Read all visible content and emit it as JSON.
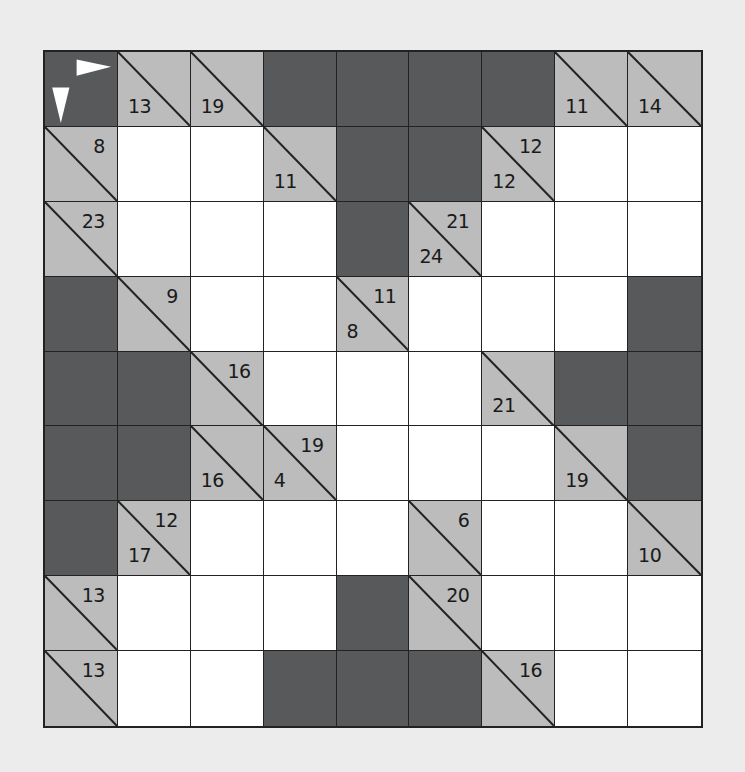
{
  "puzzle": {
    "type": "kakuro",
    "rows": 9,
    "cols": 9,
    "colors": {
      "background": "#ececec",
      "block": "#58595b",
      "clue": "#bcbcbc",
      "entry": "#ffffff",
      "line": "#222222"
    },
    "legend": {
      "corner_icon": "across-and-down-arrows-icon"
    },
    "grid": [
      [
        {
          "t": "corner"
        },
        {
          "t": "clue",
          "down": "13"
        },
        {
          "t": "clue",
          "down": "19"
        },
        {
          "t": "block"
        },
        {
          "t": "block"
        },
        {
          "t": "block"
        },
        {
          "t": "block"
        },
        {
          "t": "clue",
          "down": "11"
        },
        {
          "t": "clue",
          "down": "14"
        }
      ],
      [
        {
          "t": "clue",
          "across": "8"
        },
        {
          "t": "entry",
          "value": ""
        },
        {
          "t": "entry",
          "value": ""
        },
        {
          "t": "clue",
          "down": "11"
        },
        {
          "t": "block"
        },
        {
          "t": "block"
        },
        {
          "t": "clue",
          "across": "12",
          "down": "12"
        },
        {
          "t": "entry",
          "value": ""
        },
        {
          "t": "entry",
          "value": ""
        }
      ],
      [
        {
          "t": "clue",
          "across": "23"
        },
        {
          "t": "entry",
          "value": ""
        },
        {
          "t": "entry",
          "value": ""
        },
        {
          "t": "entry",
          "value": ""
        },
        {
          "t": "block"
        },
        {
          "t": "clue",
          "across": "21",
          "down": "24"
        },
        {
          "t": "entry",
          "value": ""
        },
        {
          "t": "entry",
          "value": ""
        },
        {
          "t": "entry",
          "value": ""
        }
      ],
      [
        {
          "t": "block"
        },
        {
          "t": "clue",
          "across": "9"
        },
        {
          "t": "entry",
          "value": ""
        },
        {
          "t": "entry",
          "value": ""
        },
        {
          "t": "clue",
          "across": "11",
          "down": "8"
        },
        {
          "t": "entry",
          "value": ""
        },
        {
          "t": "entry",
          "value": ""
        },
        {
          "t": "entry",
          "value": ""
        },
        {
          "t": "block"
        }
      ],
      [
        {
          "t": "block"
        },
        {
          "t": "block"
        },
        {
          "t": "clue",
          "across": "16"
        },
        {
          "t": "entry",
          "value": ""
        },
        {
          "t": "entry",
          "value": ""
        },
        {
          "t": "entry",
          "value": ""
        },
        {
          "t": "clue",
          "down": "21"
        },
        {
          "t": "block"
        },
        {
          "t": "block"
        }
      ],
      [
        {
          "t": "block"
        },
        {
          "t": "block"
        },
        {
          "t": "clue",
          "down": "16"
        },
        {
          "t": "clue",
          "across": "19",
          "down": "4"
        },
        {
          "t": "entry",
          "value": ""
        },
        {
          "t": "entry",
          "value": ""
        },
        {
          "t": "entry",
          "value": ""
        },
        {
          "t": "clue",
          "down": "19"
        },
        {
          "t": "block"
        }
      ],
      [
        {
          "t": "block"
        },
        {
          "t": "clue",
          "across": "12",
          "down": "17"
        },
        {
          "t": "entry",
          "value": ""
        },
        {
          "t": "entry",
          "value": ""
        },
        {
          "t": "entry",
          "value": ""
        },
        {
          "t": "clue",
          "across": "6"
        },
        {
          "t": "entry",
          "value": ""
        },
        {
          "t": "entry",
          "value": ""
        },
        {
          "t": "clue",
          "down": "10"
        }
      ],
      [
        {
          "t": "clue",
          "across": "13"
        },
        {
          "t": "entry",
          "value": ""
        },
        {
          "t": "entry",
          "value": ""
        },
        {
          "t": "entry",
          "value": ""
        },
        {
          "t": "block"
        },
        {
          "t": "clue",
          "across": "20"
        },
        {
          "t": "entry",
          "value": ""
        },
        {
          "t": "entry",
          "value": ""
        },
        {
          "t": "entry",
          "value": ""
        }
      ],
      [
        {
          "t": "clue",
          "across": "13"
        },
        {
          "t": "entry",
          "value": ""
        },
        {
          "t": "entry",
          "value": ""
        },
        {
          "t": "block"
        },
        {
          "t": "block"
        },
        {
          "t": "block"
        },
        {
          "t": "clue",
          "across": "16"
        },
        {
          "t": "entry",
          "value": ""
        },
        {
          "t": "entry",
          "value": ""
        }
      ]
    ]
  }
}
